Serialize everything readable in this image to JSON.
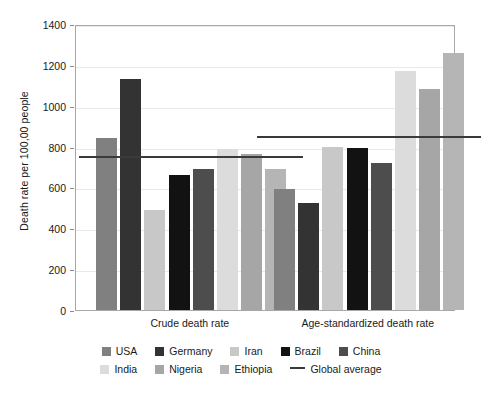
{
  "chart_data": {
    "type": "bar",
    "title": "",
    "xlabel": "",
    "ylabel": "Death rate per 100,00 people",
    "ylim": [
      0,
      1400
    ],
    "ytick_values": [
      0,
      200,
      400,
      600,
      800,
      1000,
      1200,
      1400
    ],
    "ytick_labels": [
      "0",
      "200",
      "400",
      "600",
      "800",
      "1000",
      "1200",
      "1400"
    ],
    "grid": true,
    "legend_position": "bottom",
    "categories": [
      "Crude death rate",
      "Age-standardized death rate"
    ],
    "series": [
      {
        "name": "USA",
        "color": "#808080",
        "values": [
          840,
          590
        ]
      },
      {
        "name": "Germany",
        "color": "#333333",
        "values": [
          1130,
          525
        ]
      },
      {
        "name": "Iran",
        "color": "#c8c8c8",
        "values": [
          490,
          800
        ]
      },
      {
        "name": "Brazil",
        "color": "#121212",
        "values": [
          660,
          795
        ]
      },
      {
        "name": "China",
        "color": "#4d4d4d",
        "values": [
          690,
          720
        ]
      },
      {
        "name": "India",
        "color": "#dcdcdc",
        "values": [
          790,
          1170
        ]
      },
      {
        "name": "Nigeria",
        "color": "#a6a6a6",
        "values": [
          765,
          1080
        ]
      },
      {
        "name": "Ethiopia",
        "color": "#b5b5b5",
        "values": [
          690,
          1260
        ]
      }
    ],
    "reference_line": {
      "name": "Global average",
      "color": "#3a3a3a",
      "values": [
        765,
        860
      ]
    },
    "annotations": []
  },
  "legend": {
    "rows": [
      [
        {
          "label": "USA",
          "color": "#808080",
          "kind": "swatch"
        },
        {
          "label": "Germany",
          "color": "#333333",
          "kind": "swatch"
        },
        {
          "label": "Iran",
          "color": "#c8c8c8",
          "kind": "swatch"
        },
        {
          "label": "Brazil",
          "color": "#121212",
          "kind": "swatch"
        },
        {
          "label": "China",
          "color": "#4d4d4d",
          "kind": "swatch"
        }
      ],
      [
        {
          "label": "India",
          "color": "#dcdcdc",
          "kind": "swatch"
        },
        {
          "label": "Nigeria",
          "color": "#a6a6a6",
          "kind": "swatch"
        },
        {
          "label": "Ethiopia",
          "color": "#b5b5b5",
          "kind": "swatch"
        },
        {
          "label": "Global average",
          "color": "#3a3a3a",
          "kind": "line"
        }
      ]
    ]
  },
  "theme": {
    "background": "#ffffff",
    "frame_color": "#a8a8a8",
    "grid_color": "#e9e9e9",
    "text_color": "#1a1a1a"
  }
}
